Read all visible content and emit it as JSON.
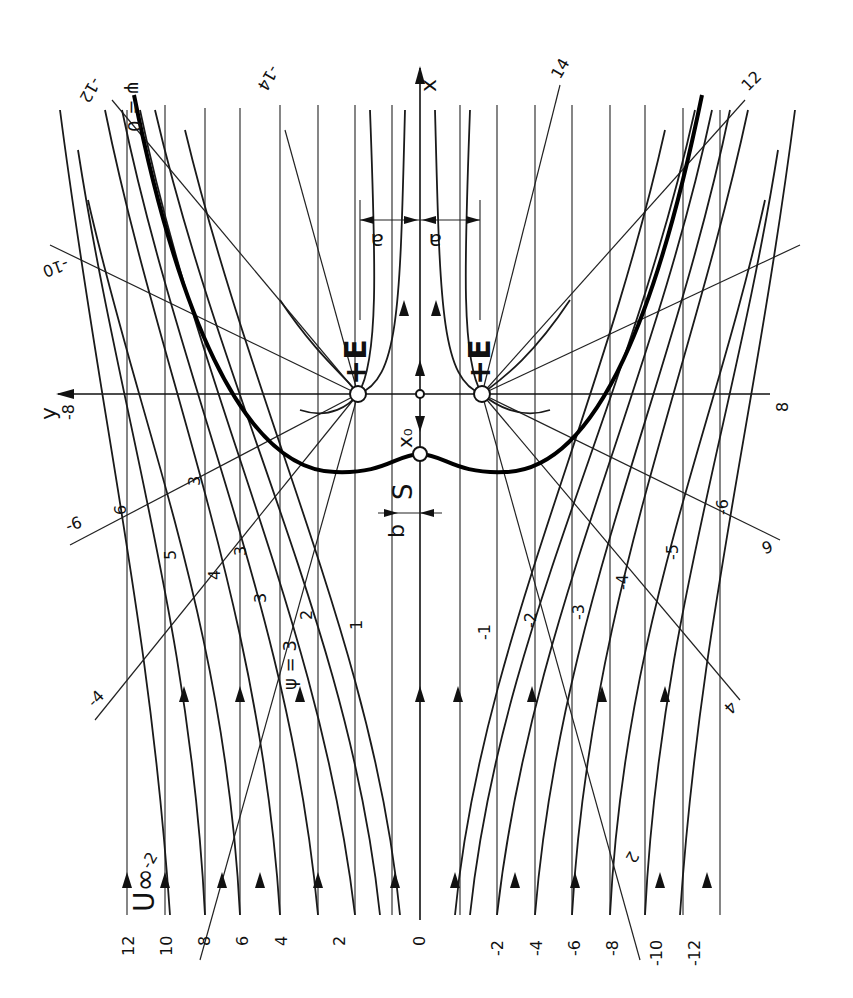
{
  "diagram": {
    "type": "potential-flow streamline diagram",
    "labels": {
      "x_axis": "x",
      "y_axis": "y",
      "free_stream": "U∞",
      "source_left": "+E",
      "source_right": "+E",
      "stagnation": "S",
      "stagnation_distance": "x₀",
      "half_spacing_left": "a",
      "half_spacing_right": "a",
      "width_marker": "b",
      "psi_zero": "ψ = 0",
      "psi_three": "ψ = 3"
    },
    "bottom_scale": [
      "12",
      "10",
      "8",
      "6",
      "4",
      "2",
      "0",
      "-2",
      "-4",
      "-6",
      "-8",
      "-10",
      "-12"
    ],
    "streamline_labels_left": [
      "1",
      "2",
      "3",
      "3",
      "3",
      "3",
      "4",
      "5",
      "6"
    ],
    "streamline_labels_right": [
      "-1",
      "-2",
      "-3",
      "-4",
      "-5",
      "-6"
    ],
    "ray_labels": {
      "top_left": [
        "ψ = 0",
        "-12",
        "-14",
        "-10",
        "-8"
      ],
      "top_right": [
        "14",
        "12",
        "8"
      ],
      "left": [
        "-6",
        "-4",
        "-2"
      ],
      "right": [
        "6",
        "4",
        "2"
      ]
    },
    "y_axis_end_labels": {
      "left": "-8",
      "right": "8"
    }
  }
}
